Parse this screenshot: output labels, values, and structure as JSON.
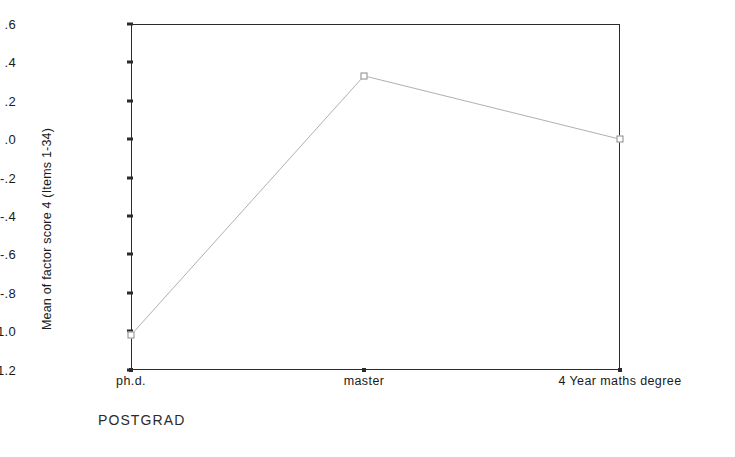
{
  "chart_data": {
    "type": "line",
    "title": "",
    "xlabel": "POSTGRAD",
    "ylabel": "Mean of factor score 4 (Items 1-34)",
    "categories": [
      "ph.d.",
      "master",
      "4 Year maths degree"
    ],
    "values": [
      -1.02,
      0.33,
      0.0
    ],
    "ylim": [
      -1.2,
      0.6
    ],
    "yticks": [
      ".6",
      ".4",
      ".2",
      ".0",
      "-.2",
      "-.4",
      "-.6",
      "-.8",
      "-1.0",
      "-1.2"
    ],
    "ytick_values": [
      0.6,
      0.4,
      0.2,
      0.0,
      -0.2,
      -0.4,
      -0.6,
      -0.8,
      -1.0,
      -1.2
    ],
    "grid": false,
    "legend": "none",
    "series": [
      {
        "name": "Mean of factor score 4 (Items 1-34)",
        "values": [
          -1.02,
          0.33,
          0.0
        ],
        "line_color": "#b0b0b0",
        "marker": "open-square",
        "marker_color": "#8a8a8a"
      }
    ],
    "colors": {
      "axis": "#2b2b2b",
      "line": "#b0b0b0",
      "marker": "#8a8a8a",
      "background": "#ffffff",
      "text": "#1a1a1a"
    }
  }
}
